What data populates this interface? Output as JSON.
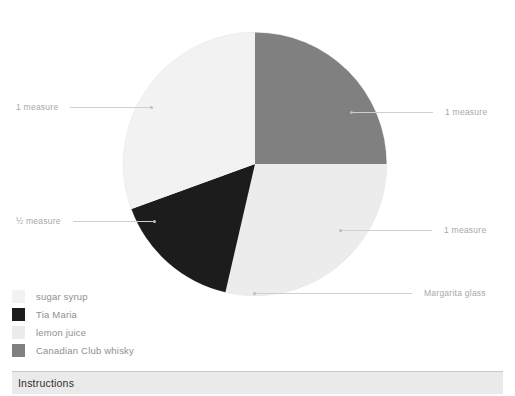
{
  "chart_data": {
    "type": "pie",
    "title": "",
    "legend_position": "bottom-left",
    "categories": [
      "sugar syrup",
      "Tia Maria",
      "lemon juice",
      "Canadian Club whisky"
    ],
    "values": [
      30.5,
      15.8,
      28.6,
      25.1
    ],
    "units": [
      "1 measure",
      "½ measure",
      "1 measure",
      "1 measure"
    ],
    "colors": [
      "#f2f2f2",
      "#1c1c1c",
      "#ececec",
      "#808080"
    ],
    "slices": [
      {
        "label": "Canadian Club whisky",
        "value": 25.1,
        "amount": "1 measure",
        "color": "#808080",
        "start_deg": 0,
        "end_deg": 90
      },
      {
        "label": "lemon juice",
        "value": 28.6,
        "amount": "1 measure",
        "color": "#ececec",
        "start_deg": 90,
        "end_deg": 193
      },
      {
        "label": "Tia Maria",
        "value": 15.8,
        "amount": "½ measure",
        "color": "#1c1c1c",
        "start_deg": 193,
        "end_deg": 250
      },
      {
        "label": "sugar syrup",
        "value": 30.5,
        "amount": "1 measure",
        "color": "#f2f2f2",
        "start_deg": 250,
        "end_deg": 360
      }
    ]
  },
  "callouts": {
    "sugar_syrup": "1 measure",
    "tia_maria": "½ measure",
    "whisky": "1 measure",
    "lemon_juice": "1 measure",
    "glass": "Margarita glass"
  },
  "legend": {
    "items": [
      {
        "label": "sugar syrup",
        "color": "#f2f2f2"
      },
      {
        "label": "Tia Maria",
        "color": "#1c1c1c"
      },
      {
        "label": "lemon juice",
        "color": "#ececec"
      },
      {
        "label": "Canadian Club whisky",
        "color": "#808080"
      }
    ]
  },
  "instructions": {
    "title": "Instructions"
  },
  "colors": {
    "leader_line": "#cfcfcf",
    "callout_text": "#a8a8a8",
    "legend_text": "#8f8f8f",
    "bar_background": "#eaeaea",
    "bar_title": "#2e2e2e"
  }
}
